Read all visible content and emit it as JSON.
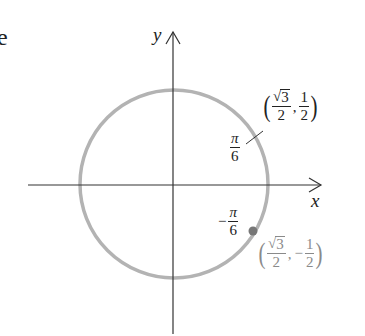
{
  "diagram": {
    "type": "unit-circle",
    "fragment_text": "e",
    "axes": {
      "x_label": "x",
      "y_label": "y"
    },
    "angles": [
      {
        "label_num": "π",
        "label_den": "6",
        "sign": "",
        "value": "π/6"
      },
      {
        "label_num": "π",
        "label_den": "6",
        "sign": "−",
        "value": "−π/6"
      }
    ],
    "points": [
      {
        "name": "upper",
        "x_num": "3",
        "x_den": "2",
        "x_root": "√",
        "y_num": "1",
        "y_den": "2",
        "y_sign": "",
        "text": "(√3/2, 1/2)",
        "highlighted": false
      },
      {
        "name": "lower",
        "x_num": "3",
        "x_den": "2",
        "x_root": "√",
        "y_num": "1",
        "y_den": "2",
        "y_sign": "−",
        "text": "(√3/2, −1/2)",
        "highlighted": true
      }
    ],
    "colors": {
      "axis": "#333333",
      "circle": "#b3b3b3",
      "point": "#777777",
      "highlight_text": "#8a8a8a",
      "text": "#222222"
    }
  }
}
